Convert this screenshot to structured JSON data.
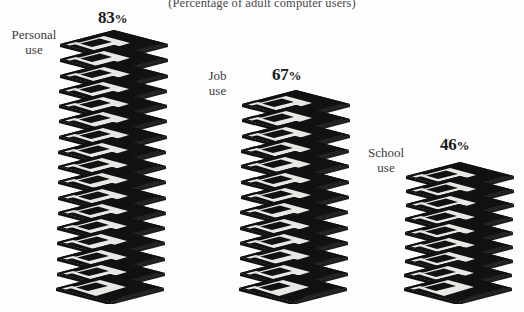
{
  "page": {
    "subtitle": "(Percentage of adult computer users)",
    "background_color": "#fdfdfd",
    "ink_color": "#111111",
    "label_color": "#3b3b3b"
  },
  "chart_data": {
    "type": "bar",
    "title": "",
    "subtitle": "(Percentage of adult computer users)",
    "xlabel": "",
    "ylabel": "",
    "unit": "%",
    "pictogram": "floppy-disk",
    "categories": [
      "Personal use",
      "Job use",
      "School use"
    ],
    "values": [
      83,
      67,
      46
    ],
    "value_labels": [
      "83%",
      "67%",
      "46%"
    ],
    "icon_counts": [
      17,
      13,
      9
    ],
    "grid": false,
    "legend": "none",
    "ylim": [
      0,
      100
    ]
  },
  "groups": [
    {
      "id": "personal",
      "label_line1": "Personal",
      "label_line2": "use",
      "value_number": "83",
      "value_symbol": "%",
      "value": 83,
      "disks": 17
    },
    {
      "id": "job",
      "label_line1": "Job",
      "label_line2": "use",
      "value_number": "67",
      "value_symbol": "%",
      "value": 67,
      "disks": 13
    },
    {
      "id": "school",
      "label_line1": "School",
      "label_line2": "use",
      "value_number": "46",
      "value_symbol": "%",
      "value": 46,
      "disks": 9
    }
  ]
}
